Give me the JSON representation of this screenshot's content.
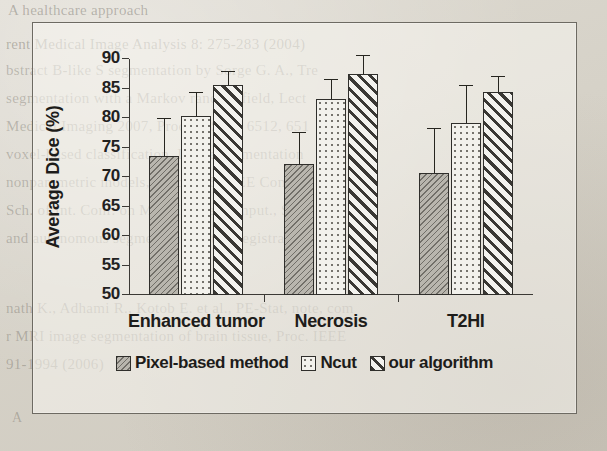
{
  "chart_data": {
    "type": "bar",
    "title": "",
    "xlabel": "",
    "ylabel": "Average Dice (%)",
    "ylim": [
      50,
      90
    ],
    "yticks": [
      50,
      55,
      60,
      65,
      70,
      75,
      80,
      85,
      90
    ],
    "grid": false,
    "legend_position": "bottom-center",
    "categories": [
      "Enhanced tumor",
      "Necrosis",
      "T2HI"
    ],
    "series": [
      {
        "name": "Pixel-based method",
        "values": [
          73.5,
          72.2,
          70.7
        ],
        "errors": [
          6.3,
          5.3,
          7.4
        ],
        "pattern": "diagonal-dotted-gray",
        "color": "#b9b6ae"
      },
      {
        "name": "Ncut",
        "values": [
          80.4,
          83.2,
          79.1
        ],
        "errors": [
          3.8,
          3.2,
          6.4
        ],
        "pattern": "fine-dots-white",
        "color": "#f2f1ec"
      },
      {
        "name": "our algorithm",
        "values": [
          85.6,
          87.5,
          84.4
        ],
        "errors": [
          2.2,
          3.0,
          2.5
        ],
        "pattern": "diagonal-stripes",
        "color": "#efeee9"
      }
    ]
  },
  "figure": {
    "frame_color": "#6d6a62",
    "axis_color": "#3b3935",
    "text_color": "#1d1c1a"
  },
  "background_text": {
    "lines": [
      "A healthcare approach",
      "rent Medical Image Analysis 8: 275-283 (2004)",
      "bstract B-like S segmentation by Sorge G. A., Tre",
      "segmentation with a Markov random field, Lect",
      "Medical Imaging 2007, Proc. of SPIE 6512, 651",
      "voxel-based classification, Image segmentation",
      "nonparametric models, Proc 2005 IEEE Comput",
      "Sch. of Int. Conf. on Med. Image Comput., Si",
      "and autonomous segmentation Atlas registration",
      "nath K., Adhami R., Kotob E. et al., PE-Stat, note, com",
      "r MRI image segmentation of brain tissue, Proc. IEEE",
      "91-1994 (2006)",
      "A"
    ]
  }
}
